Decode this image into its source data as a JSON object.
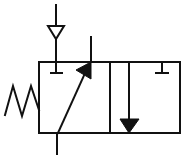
{
  "diagram": {
    "type": "pneumatic-valve-symbol",
    "colors": {
      "line": "#111111",
      "background": "#ffffff"
    },
    "envelopes": [
      {
        "id": "left",
        "content": "flow path from bottom port to top-right port (arrow diagonal), blocked supply (T)"
      },
      {
        "id": "right",
        "content": "flow arrow downward, blocked port (T)"
      }
    ],
    "actuator": {
      "type": "spring",
      "side": "left"
    },
    "ports": [
      {
        "id": "supply",
        "position": "top-left",
        "symbol": "open-triangle-source"
      },
      {
        "id": "output",
        "position": "top"
      },
      {
        "id": "exhaust",
        "position": "bottom"
      }
    ]
  }
}
